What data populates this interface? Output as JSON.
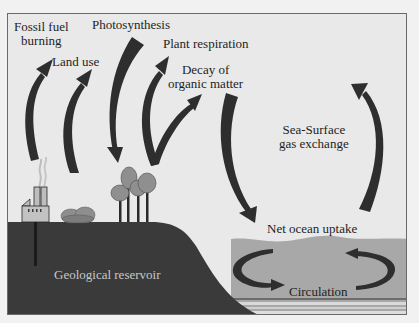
{
  "diagram": {
    "colors": {
      "sky": "#e9e9e9",
      "land": "#3a3a3a",
      "ocean": "#a6a6a6",
      "arrow": "#2e2e2e",
      "frame": "#6a6a6a"
    },
    "labels": {
      "fossil_fuel_line1": "Fossil fuel",
      "fossil_fuel_line2": "burning",
      "land_use": "Land use",
      "photosynthesis": "Photosynthesis",
      "plant_respiration": "Plant respiration",
      "decay_line1": "Decay of",
      "decay_line2": "organic matter",
      "sea_surface_line1": "Sea-Surface",
      "sea_surface_line2": "gas exchange",
      "net_ocean_uptake": "Net ocean uptake",
      "circulation": "Circulation",
      "geological_reservoir": "Geological reservoir"
    },
    "icons": {
      "factory": "factory-icon",
      "shrubs": "shrub-icon",
      "trees": "tree-icon"
    }
  }
}
